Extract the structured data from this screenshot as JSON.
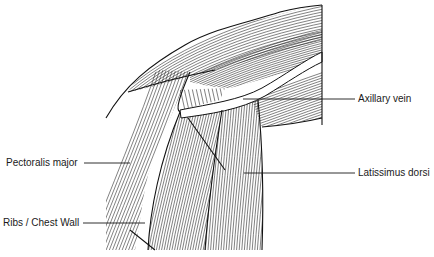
{
  "figure": {
    "type": "anatomical line illustration",
    "background_color": "#ffffff",
    "line_color": "#1a1a1a"
  },
  "labels": {
    "axillary_vein": "Axillary vein",
    "pectoralis_major": "Pectoralis major",
    "latissimus_dorsi": "Latissimus dorsi",
    "ribs_chest_wall": "Ribs / Chest Wall"
  },
  "leaders": [
    {
      "name": "axillary-vein",
      "x1": 243,
      "y1": 99,
      "x2": 355,
      "y2": 99
    },
    {
      "name": "pectoralis-major",
      "x1": 84,
      "y1": 163,
      "x2": 130,
      "y2": 163
    },
    {
      "name": "latissimus-dorsi",
      "x1": 244,
      "y1": 173,
      "x2": 355,
      "y2": 173
    },
    {
      "name": "ribs-chest-wall",
      "x1": 83,
      "y1": 223,
      "x2": 145,
      "y2": 223
    }
  ]
}
